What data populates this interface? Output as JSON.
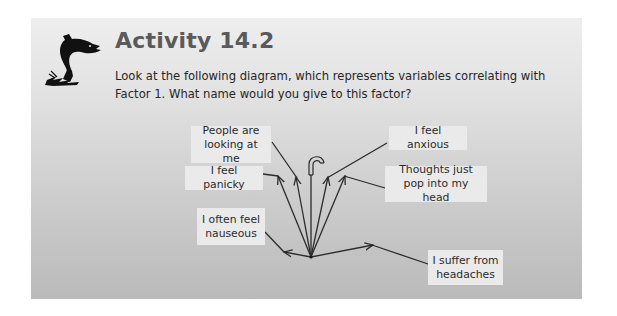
{
  "activity": {
    "icon": "leaping-fish-icon",
    "title": "Activity 14.2",
    "prompt": "Look at the following diagram, which represents variables correlating with Factor 1. What name would you give to this factor?"
  },
  "diagram": {
    "type": "umbrella-factor-diagram",
    "center_icon": "umbrella-handle-icon",
    "factor": "Factor 1",
    "variables": [
      {
        "id": "people",
        "label": "People are looking at me"
      },
      {
        "id": "panicky",
        "label": "I feel panicky"
      },
      {
        "id": "anxious",
        "label": "I feel anxious"
      },
      {
        "id": "thoughts",
        "label": "Thoughts just pop into my head"
      },
      {
        "id": "nauseous",
        "label": "I often feel nauseous"
      },
      {
        "id": "headaches",
        "label": "I suffer from headaches"
      }
    ]
  },
  "colors": {
    "panel_top": "#eeeeee",
    "panel_bottom": "#bababa",
    "title": "#5a5a5a",
    "text": "#262626",
    "label_bg": "#eaeaea",
    "line": "#2b2b2b"
  }
}
